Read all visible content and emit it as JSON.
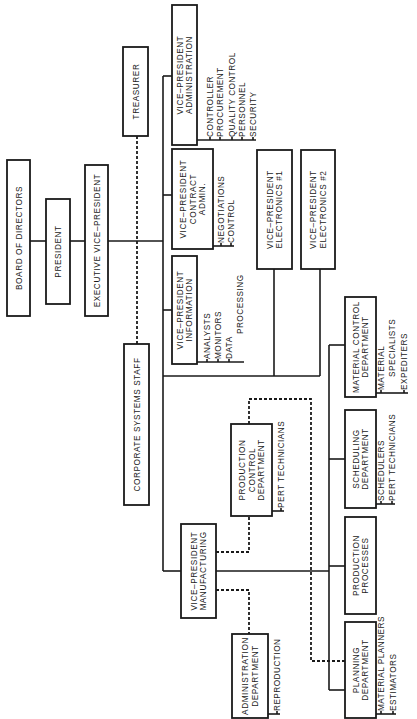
{
  "chart": {
    "type": "organizational-chart",
    "orientation": "rotated-counterclockwise",
    "nodes": {
      "board": {
        "lines": [
          "BOARD OF DIRECTORS"
        ]
      },
      "president": {
        "lines": [
          "PRESIDENT"
        ]
      },
      "exec_vp": {
        "lines": [
          "EXECUTIVE VICE–PRESIDENT"
        ]
      },
      "treasurer": {
        "lines": [
          "TREASURER"
        ]
      },
      "corp_systems": {
        "lines": [
          "CORPORATE SYSTEMS STAFF"
        ]
      },
      "vp_admin": {
        "lines": [
          "VICE–PRESIDENT",
          "ADMINISTRATION"
        ],
        "subs": [
          "CONTROLLER",
          "PROCUREMENT",
          "QUALITY CONTROL",
          "PERSONNEL",
          "SECURITY"
        ]
      },
      "vp_contract": {
        "lines": [
          "VICE–PRESIDENT",
          "CONTRACT",
          "ADMIN."
        ],
        "subs": [
          "NEGOTIATIONS",
          "CONTROL"
        ]
      },
      "vp_info": {
        "lines": [
          "VICE–PRESIDENT",
          "INFORMATION"
        ],
        "subs": [
          "ANALYSTS",
          "MONITORS",
          "DATA",
          "PROCESSING"
        ]
      },
      "vp_elec1": {
        "lines": [
          "VICE–PRESIDENT",
          "ELECTRONICS #1"
        ]
      },
      "vp_elec2": {
        "lines": [
          "VICE–PRESIDENT",
          "ELECTRONICS #2"
        ]
      },
      "material_control": {
        "lines": [
          "MATERIAL CONTROL",
          "DEPARTMENT"
        ],
        "subs": [
          "MATERIAL",
          "SPECIALISTS",
          "EXPEDITERS"
        ]
      },
      "scheduling": {
        "lines": [
          "SCHEDULING",
          "DEPARTMENT"
        ],
        "subs": [
          "SCHEDULERS",
          "PERT TECHNICIANS"
        ]
      },
      "production_processes": {
        "lines": [
          "PRODUCTION",
          "PROCESSES"
        ]
      },
      "planning": {
        "lines": [
          "PLANNING",
          "DEPARTMENT"
        ],
        "subs": [
          "MATERIAL PLANNERS",
          "ESTIMATORS"
        ]
      },
      "production_control": {
        "lines": [
          "PRODUCTION",
          "CONTROL",
          "DEPARTMENT"
        ],
        "subs": [
          "PERT TECHNICIANS"
        ]
      },
      "vp_mfg": {
        "lines": [
          "VICE–PRESIDENT",
          "MANUFACTURING"
        ]
      },
      "admin_dept": {
        "lines": [
          "ADMINISTRATION",
          "DEPARTMENT"
        ],
        "subs": [
          "REPRODUCTION"
        ]
      }
    },
    "solid_links": [
      [
        "board",
        "president"
      ],
      [
        "president",
        "exec_vp"
      ],
      [
        "exec_vp",
        "vp_admin"
      ],
      [
        "exec_vp",
        "vp_contract"
      ],
      [
        "exec_vp",
        "vp_info"
      ],
      [
        "exec_vp",
        "vp_elec1"
      ],
      [
        "exec_vp",
        "vp_elec2"
      ],
      [
        "exec_vp",
        "vp_mfg"
      ],
      [
        "vp_mfg",
        "material_control"
      ],
      [
        "vp_mfg",
        "scheduling"
      ],
      [
        "vp_mfg",
        "production_processes"
      ],
      [
        "vp_mfg",
        "planning"
      ]
    ],
    "dashed_links": [
      [
        "treasurer",
        "corp_systems"
      ],
      [
        "vp_mfg",
        "production_control"
      ],
      [
        "vp_mfg",
        "admin_dept"
      ],
      [
        "production_control",
        "planning"
      ]
    ]
  }
}
